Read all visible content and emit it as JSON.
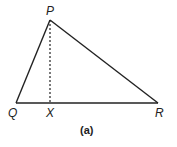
{
  "diagram": {
    "caption": "(a)",
    "stroke_color": "#222222",
    "vertices": {
      "P": {
        "label": "P",
        "x": 50,
        "y": 20
      },
      "Q": {
        "label": "Q",
        "x": 16,
        "y": 103
      },
      "R": {
        "label": "R",
        "x": 158,
        "y": 103
      },
      "X": {
        "label": "X",
        "x": 50,
        "y": 103
      }
    },
    "edges": [
      {
        "from": "P",
        "to": "Q",
        "style": "solid"
      },
      {
        "from": "P",
        "to": "R",
        "style": "solid"
      },
      {
        "from": "Q",
        "to": "R",
        "style": "solid"
      },
      {
        "from": "P",
        "to": "X",
        "style": "dashed"
      }
    ]
  }
}
